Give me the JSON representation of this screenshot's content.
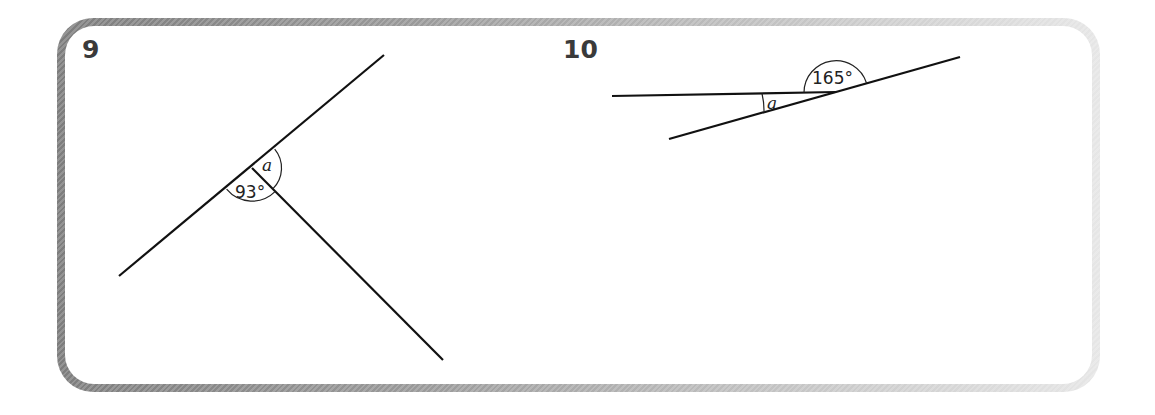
{
  "questions": [
    {
      "number": "9",
      "angles": [
        {
          "label": "a",
          "type": "unknown"
        },
        {
          "label": "93°",
          "type": "given"
        }
      ]
    },
    {
      "number": "10",
      "angles": [
        {
          "label": "165°",
          "type": "given"
        },
        {
          "label": "a",
          "type": "unknown"
        }
      ]
    }
  ],
  "colors": {
    "frame_dark": "#7d7d7d",
    "frame_light": "#e6e6e6",
    "number_text": "#3a3a3a",
    "line": "#111111"
  }
}
